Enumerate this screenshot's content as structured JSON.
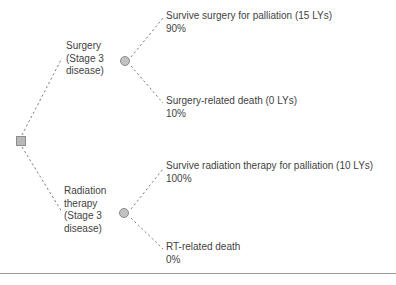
{
  "diagram": {
    "type": "decision-tree",
    "root": {
      "node_kind": "decision",
      "shape": "square"
    },
    "branches": [
      {
        "id": "surgery",
        "label_lines": [
          "Surgery",
          "(Stage 3",
          "disease)"
        ],
        "node_kind": "chance",
        "shape": "circle",
        "outcomes": [
          {
            "id": "surgery-survive",
            "title": "Survive surgery for palliation (15 LYs)",
            "probability": "90%",
            "life_years": 15
          },
          {
            "id": "surgery-death",
            "title": "Surgery-related death (0 LYs)",
            "probability": "10%",
            "life_years": 0
          }
        ]
      },
      {
        "id": "radiation",
        "label_lines": [
          "Radiation",
          "therapy",
          "(Stage 3",
          "disease)"
        ],
        "node_kind": "chance",
        "shape": "circle",
        "outcomes": [
          {
            "id": "rt-survive",
            "title": "Survive radiation therapy for palliation (10 LYs)",
            "probability": "100%",
            "life_years": 10
          },
          {
            "id": "rt-death",
            "title": "RT-related death",
            "probability": "0%",
            "life_years": null
          }
        ]
      }
    ]
  },
  "labels": {
    "surgery_line_1": "Surgery",
    "surgery_line_2": "(Stage 3",
    "surgery_line_3": "disease)",
    "radiation_line_1": "Radiation",
    "radiation_line_2": "therapy",
    "radiation_line_3": "(Stage 3",
    "radiation_line_4": "disease)"
  },
  "outcomes": {
    "surgery_survive_title": "Survive surgery for palliation (15 LYs)",
    "surgery_survive_prob": "90%",
    "surgery_death_title": "Surgery-related death (0 LYs)",
    "surgery_death_prob": "10%",
    "rt_survive_title": "Survive radiation therapy for palliation (10 LYs)",
    "rt_survive_prob": "100%",
    "rt_death_title": "RT-related death",
    "rt_death_prob": "0%"
  },
  "colors": {
    "node_fill": "#c2c2c2",
    "node_stroke": "#8a8a8a",
    "edge": "#7d7d7d",
    "text": "#3f3f3f",
    "rule": "#9a9a9a",
    "background": "#ffffff"
  }
}
